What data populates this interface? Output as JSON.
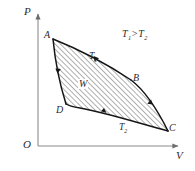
{
  "figure": {
    "type": "pv-cycle-diagram",
    "background": "#ffffff",
    "axes": {
      "y_label": "P",
      "x_label": "V",
      "origin_label": "O",
      "axis_color": "#8a8a8a",
      "x_axis": {
        "x_start": 38,
        "x_end": 180,
        "y": 146
      },
      "y_axis": {
        "x": 38,
        "y_start": 12,
        "y_end": 146
      }
    },
    "annotation": {
      "text": "T1>T2",
      "t_left": "T",
      "sub_left": "1",
      "relation": ">",
      "t_right": "T",
      "sub_right": "2"
    },
    "vertices": [
      {
        "name": "A",
        "label": "A",
        "x": 53,
        "y": 39
      },
      {
        "name": "B",
        "label": "B",
        "x": 131,
        "y": 80
      },
      {
        "name": "C",
        "label": "C",
        "x": 168,
        "y": 131
      },
      {
        "name": "D",
        "label": "D",
        "x": 66,
        "y": 104
      }
    ],
    "curves": [
      {
        "name": "isotherm-upper",
        "from": "A",
        "to": "B",
        "label": "T1",
        "label_text": "T",
        "label_sub": "1"
      },
      {
        "name": "adiabat-right",
        "from": "B",
        "to": "C",
        "label": ""
      },
      {
        "name": "isotherm-lower",
        "from": "C",
        "to": "D",
        "label": "T2",
        "label_text": "T",
        "label_sub": "2"
      },
      {
        "name": "adiabat-left",
        "from": "D",
        "to": "A",
        "label": ""
      }
    ],
    "work_label": {
      "text": "W",
      "x": 78,
      "y": 79
    },
    "hatching": {
      "angle_deg": 45,
      "spacing_px": 2.6,
      "color": "#4a4a4a"
    },
    "curve_color": "#1a1a1a",
    "cycle_direction": "clockwise"
  }
}
